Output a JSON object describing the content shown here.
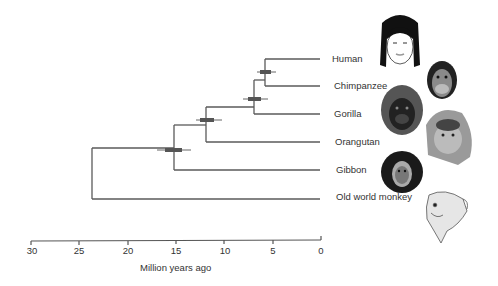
{
  "diagram": {
    "type": "phylogenetic-tree",
    "axis": {
      "title": "Million years ago",
      "ticks": [
        "30",
        "25",
        "20",
        "15",
        "10",
        "5",
        "0"
      ]
    },
    "taxa": [
      {
        "name": "Human"
      },
      {
        "name": "Chimpanzee"
      },
      {
        "name": "Gorilla"
      },
      {
        "name": "Orangutan"
      },
      {
        "name": "Gibbon"
      },
      {
        "name": "Old world monkey"
      }
    ],
    "divergences_mya": {
      "human_chimpanzee": 6,
      "gorilla": 7,
      "orangutan": 12,
      "gibbon": 15,
      "old_world_monkey": 23.5
    },
    "colors": {
      "branch": "#555555",
      "error_bar": "#555555"
    }
  }
}
